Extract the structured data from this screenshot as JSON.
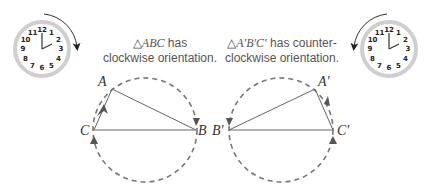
{
  "left_panel": {
    "caption_line1_prefix": "△",
    "caption_line1_italic": "ABC",
    "caption_line1_suffix": " has",
    "caption_line2": "clockwise orientation.",
    "clock": {
      "label": "clock-clockwise",
      "time": "2:00",
      "direction": "clockwise"
    },
    "vertices": {
      "A": "A",
      "B": "B",
      "C": "C"
    }
  },
  "right_panel": {
    "caption_line1_prefix": "△",
    "caption_line1_italic": "A′B′C′",
    "caption_line1_suffix": " has counter-",
    "caption_line2": "clockwise orientation.",
    "clock": {
      "label": "clock-counterclockwise",
      "time": "2:00",
      "direction": "counterclockwise"
    },
    "vertices": {
      "A": "A′",
      "B": "B′",
      "C": "C′"
    }
  },
  "clock_numbers": [
    "12",
    "1",
    "2",
    "3",
    "4",
    "5",
    "6",
    "7",
    "8",
    "9",
    "10",
    "11"
  ],
  "colors": {
    "line": "#666666",
    "dash": "#777777",
    "clock_rim": "#cccccc",
    "text": "#555555"
  }
}
